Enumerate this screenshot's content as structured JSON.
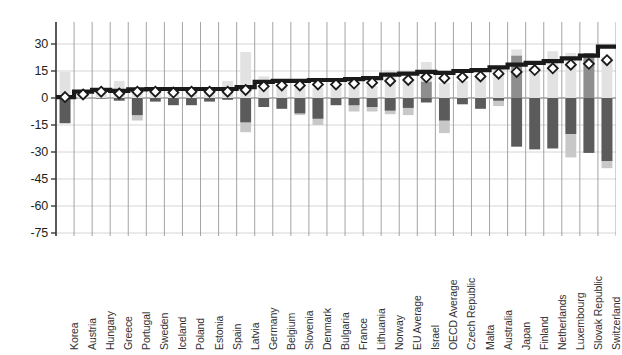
{
  "chart_data": {
    "type": "bar",
    "title": "",
    "subtitle": "",
    "xlabel": "",
    "ylabel": "",
    "ylim": [
      -75,
      36
    ],
    "yticks": [
      30,
      15,
      0,
      -15,
      -30,
      -45,
      -60,
      -75
    ],
    "ytick_labels": [
      "30",
      "15",
      "0",
      "-15",
      "-30",
      "-45",
      "-60",
      "-75"
    ],
    "grid": true,
    "grid_orientation": "vertical-and-horizontal",
    "legend": [],
    "categories": [
      "Korea",
      "Austria",
      "Hungary",
      "Greece",
      "Portugal",
      "Sweden",
      "Iceland",
      "Poland",
      "Estonia",
      "Spain",
      "Latvia",
      "Germany",
      "Belgium",
      "Slovenia",
      "Denmark",
      "Bulgaria",
      "France",
      "Lithuania",
      "Norway",
      "EU Average",
      "Israel",
      "OECD Average",
      "Czech Republic",
      "Malta",
      "Australia",
      "Japan",
      "Finland",
      "Netherlands",
      "Luxembourg",
      "Slovak Republic",
      "Switzerland"
    ],
    "series": [
      {
        "name": "positive-bar-light",
        "color": "#e2e2e2",
        "values": [
          14.5,
          1.5,
          2.5,
          9.5,
          3.0,
          4.0,
          2.5,
          4.0,
          2.5,
          9.5,
          25.5,
          12.0,
          8.0,
          6.0,
          5.5,
          6.0,
          11.0,
          6.5,
          15.0,
          9.5,
          20.0,
          8.5,
          9.5,
          12.0,
          16.0,
          27.0,
          17.0,
          26.0,
          25.0,
          24.5,
          23.0
        ]
      },
      {
        "name": "positive-bar-dark-cap",
        "color": "#8e8e8e",
        "values": [
          0,
          0,
          0,
          0,
          0,
          0,
          0,
          0,
          0,
          0,
          0,
          0,
          0,
          0,
          0,
          0,
          0,
          0,
          0,
          0,
          9.0,
          0,
          0,
          0,
          0,
          23.5,
          0,
          0,
          0,
          25.0,
          0
        ]
      },
      {
        "name": "negative-bar-dark",
        "color": "#5b5b5b",
        "values": [
          -14.0,
          0,
          -0.3,
          -1.5,
          -9.5,
          -2.0,
          -4.0,
          -4.0,
          -2.0,
          -1.0,
          -13.5,
          -5.0,
          -6.0,
          -8.5,
          -11.5,
          -4.0,
          -4.0,
          -5.0,
          -7.0,
          -5.5,
          -2.5,
          -12.5,
          -3.5,
          -6.0,
          -1.5,
          -27.0,
          -28.5,
          -28.0,
          -20.0,
          -30.5,
          -35.0
        ]
      },
      {
        "name": "negative-bar-light-extension",
        "color": "#c8c8c8",
        "values": [
          -14.0,
          0,
          0,
          0,
          -12.5,
          0,
          0,
          0,
          0,
          0,
          -19.0,
          0,
          0,
          -9.5,
          -15.0,
          0,
          -7.5,
          -7.5,
          -9.0,
          -9.5,
          0,
          -19.5,
          0,
          0,
          -4.5,
          -27.0,
          -28.5,
          -28.0,
          -33.0,
          -30.5,
          -39.0
        ]
      },
      {
        "name": "net-line",
        "type": "step-line",
        "color": "#1a1a1a",
        "values": [
          0.5,
          3.5,
          4.5,
          4.0,
          4.8,
          5.0,
          5.0,
          5.0,
          5.0,
          5.0,
          6.0,
          9.0,
          9.5,
          9.5,
          10.0,
          10.0,
          10.5,
          11.0,
          13.0,
          13.5,
          14.5,
          14.0,
          15.0,
          15.5,
          17.0,
          18.5,
          19.5,
          20.5,
          22.0,
          23.5,
          28.5
        ]
      },
      {
        "name": "diamond-marker",
        "type": "marker",
        "marker": "diamond",
        "color": "#1a1a1a",
        "values": [
          0.5,
          2.0,
          3.5,
          2.5,
          3.5,
          3.5,
          3.0,
          3.5,
          3.5,
          3.5,
          4.5,
          6.5,
          7.0,
          7.0,
          7.5,
          7.5,
          8.0,
          8.5,
          9.5,
          10.0,
          11.5,
          11.0,
          11.5,
          12.0,
          13.5,
          14.5,
          15.5,
          16.5,
          18.5,
          19.0,
          21.0
        ]
      }
    ]
  },
  "axis": {
    "y_title": "",
    "x_title": ""
  }
}
